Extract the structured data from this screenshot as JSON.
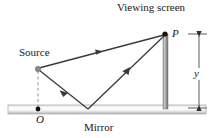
{
  "figure": {
    "labels": {
      "viewing_screen": "Viewing screen",
      "source": "Source",
      "mirror": "Mirror",
      "point_p": "P",
      "point_o": "O",
      "distance_y": "y"
    },
    "colors": {
      "ray": "#3a3a3a",
      "mirror_edge": "#9a9a9a",
      "mirror_fill_light": "#f2f2f2",
      "mirror_fill_mid": "#ffffff",
      "mirror_fill_dark": "#bfbfbf",
      "screen_bar": "#8f8f8f",
      "source_dot": "#8a8a8a",
      "point_dot": "#000000",
      "dashed_line": "#9a9a9a",
      "dimension_line": "#4a4a4a",
      "text": "#1a1a1a"
    },
    "geometry": {
      "source_point": [
        38,
        69
      ],
      "point_p": [
        166,
        34
      ],
      "point_o": [
        38,
        110
      ],
      "mirror_reflection_point": [
        88,
        110
      ],
      "mirror_bar": {
        "x": 8,
        "y": 105,
        "width": 198,
        "height": 9
      },
      "screen_bar": {
        "x": 163,
        "y": 33,
        "width": 5,
        "height": 76
      },
      "dimension_x": 199,
      "dimension_top_y": 34,
      "dimension_bottom_y": 108
    },
    "elements": [
      "direct-ray-source-to-p",
      "incident-ray-source-to-mirror",
      "reflected-ray-mirror-to-p",
      "dashed-vertical-source-to-o",
      "mirror-surface-bar",
      "viewing-screen-bar",
      "y-dimension-arrow"
    ]
  }
}
